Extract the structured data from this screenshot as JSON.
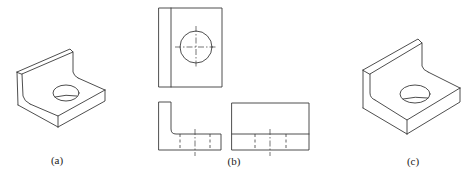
{
  "figure": {
    "panels": [
      {
        "id": "a",
        "label": "(a)",
        "description": "Isometric view of L-bracket with hole (rounded inner corner)"
      },
      {
        "id": "b",
        "label": "(b)",
        "description": "Three-view orthographic projection: top view, side view, front view"
      },
      {
        "id": "c",
        "label": "(c)",
        "description": "Isometric view of L-bracket with hole"
      }
    ],
    "line_color": "#3a3a3a",
    "background": "#ffffff"
  }
}
